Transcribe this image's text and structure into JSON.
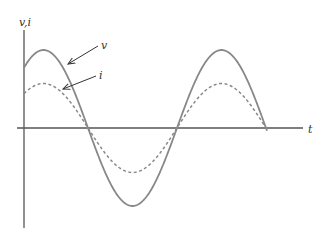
{
  "chart_data": {
    "type": "line",
    "title": "",
    "xlabel": "t",
    "ylabel": "v,i",
    "grid": false,
    "series": [
      {
        "name": "v",
        "style": "solid",
        "amplitude": 1.0,
        "phase": "in phase"
      },
      {
        "name": "i",
        "style": "dashed",
        "amplitude": 0.57,
        "phase": "in phase"
      }
    ],
    "annotations": [
      {
        "text": "v",
        "points_to": "solid curve"
      },
      {
        "text": "i",
        "points_to": "dashed curve"
      }
    ]
  },
  "labels": {
    "y_axis": "v,i",
    "x_axis": "t",
    "v": "v",
    "i": "i"
  },
  "colors": {
    "axis": "#555555",
    "curve": "#888888",
    "arrow": "#333333"
  }
}
